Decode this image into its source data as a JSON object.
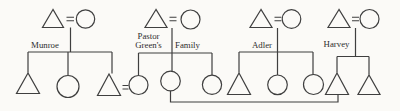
{
  "diagram": {
    "type": "kinship-diagram",
    "notation": {
      "male_symbol": "triangle",
      "female_symbol": "circle",
      "marriage_symbol": "="
    },
    "families": [
      {
        "label": "Munroe",
        "parents": "male = female",
        "children": [
          "male",
          "female",
          "male"
        ]
      },
      {
        "label_line1": "Pastor",
        "label_line2": "Green's",
        "label_line3": "Family",
        "parents": "male = female",
        "children": [
          "female",
          "female",
          "female"
        ]
      },
      {
        "label": "Adler",
        "parents": "male = female",
        "children": [
          "male",
          "female",
          "female"
        ]
      },
      {
        "label": "Harvey",
        "parents": "male = female",
        "children": [
          "male",
          "male"
        ]
      }
    ],
    "marriage_links": [
      {
        "between": "Munroe child 3 (male) and Green child 1 (female)",
        "drawn_as": "equals sign"
      },
      {
        "between": "Green child 2 (female) and Harvey child 1 (male)",
        "drawn_as": "bottom connector line"
      }
    ],
    "colors": {
      "background": "#fbfaf7",
      "line": "#3f3f3f",
      "text": "#2e2e2e"
    }
  }
}
